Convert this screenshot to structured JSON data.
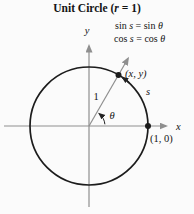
{
  "title": {
    "pre": "Unit Circle (",
    "var": "r",
    "post": " = 1)"
  },
  "equations": {
    "line1": {
      "fn": "sin ",
      "var1": "s",
      "mid": " = sin ",
      "var2": "θ"
    },
    "line2": {
      "fn": "cos ",
      "var1": "s",
      "mid": " = cos ",
      "var2": "θ"
    }
  },
  "labels": {
    "y_axis": "y",
    "x_axis": "x",
    "radius": "1",
    "angle": "θ",
    "arc_length": "s",
    "point_on_circle": "(x, y)",
    "point_x_intercept": "(1, 0)"
  },
  "colors": {
    "ink": "#1c1c1c",
    "axis": "#8f8f8f",
    "text": "#141414",
    "background": "#fbfbfb"
  }
}
